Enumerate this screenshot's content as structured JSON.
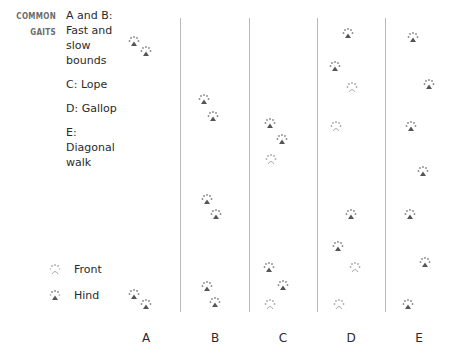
{
  "heading": {
    "line1": "COMMON",
    "line2": "GAITS"
  },
  "gaits": [
    {
      "label": "A and B: Fast and slow bounds"
    },
    {
      "label": "C: Lope"
    },
    {
      "label": "D: Gallop"
    },
    {
      "label": "E: Diagonal walk"
    }
  ],
  "legend": {
    "front": "Front",
    "hind": "Hind"
  },
  "columns": [
    {
      "label": "A",
      "x": 146
    },
    {
      "label": "B",
      "x": 215
    },
    {
      "label": "C",
      "x": 283
    },
    {
      "label": "D",
      "x": 351
    },
    {
      "label": "E",
      "x": 419
    }
  ],
  "dividers": [
    180,
    249,
    317,
    385
  ],
  "colors": {
    "hind_pad": "#555555",
    "front_pad": "#aaaaaa",
    "divider": "#b8b8b8"
  },
  "prints": [
    {
      "col": "A",
      "type": "hind",
      "x": 134,
      "y": 42
    },
    {
      "col": "A",
      "type": "hind",
      "x": 146,
      "y": 52
    },
    {
      "col": "A",
      "type": "hind",
      "x": 134,
      "y": 295
    },
    {
      "col": "A",
      "type": "hind",
      "x": 146,
      "y": 305
    },
    {
      "col": "B",
      "type": "hind",
      "x": 204,
      "y": 100
    },
    {
      "col": "B",
      "type": "hind",
      "x": 213,
      "y": 117
    },
    {
      "col": "B",
      "type": "hind",
      "x": 207,
      "y": 200
    },
    {
      "col": "B",
      "type": "hind",
      "x": 216,
      "y": 215
    },
    {
      "col": "B",
      "type": "hind",
      "x": 207,
      "y": 287
    },
    {
      "col": "B",
      "type": "hind",
      "x": 215,
      "y": 303
    },
    {
      "col": "C",
      "type": "hind",
      "x": 270,
      "y": 124
    },
    {
      "col": "C",
      "type": "hind",
      "x": 282,
      "y": 140
    },
    {
      "col": "C",
      "type": "front",
      "x": 271,
      "y": 160
    },
    {
      "col": "C",
      "type": "hind",
      "x": 269,
      "y": 268
    },
    {
      "col": "C",
      "type": "hind",
      "x": 283,
      "y": 286
    },
    {
      "col": "C",
      "type": "front",
      "x": 270,
      "y": 305
    },
    {
      "col": "D",
      "type": "hind",
      "x": 348,
      "y": 34
    },
    {
      "col": "D",
      "type": "hind",
      "x": 335,
      "y": 67
    },
    {
      "col": "D",
      "type": "front",
      "x": 352,
      "y": 88
    },
    {
      "col": "D",
      "type": "front",
      "x": 336,
      "y": 127
    },
    {
      "col": "D",
      "type": "hind",
      "x": 351,
      "y": 215
    },
    {
      "col": "D",
      "type": "hind",
      "x": 338,
      "y": 247
    },
    {
      "col": "D",
      "type": "front",
      "x": 355,
      "y": 268
    },
    {
      "col": "D",
      "type": "front",
      "x": 339,
      "y": 305
    },
    {
      "col": "E",
      "type": "hind",
      "x": 413,
      "y": 38
    },
    {
      "col": "E",
      "type": "hind",
      "x": 429,
      "y": 85
    },
    {
      "col": "E",
      "type": "hind",
      "x": 411,
      "y": 127
    },
    {
      "col": "E",
      "type": "hind",
      "x": 423,
      "y": 172
    },
    {
      "col": "E",
      "type": "hind",
      "x": 410,
      "y": 215
    },
    {
      "col": "E",
      "type": "hind",
      "x": 425,
      "y": 263
    },
    {
      "col": "E",
      "type": "hind",
      "x": 408,
      "y": 305
    }
  ]
}
